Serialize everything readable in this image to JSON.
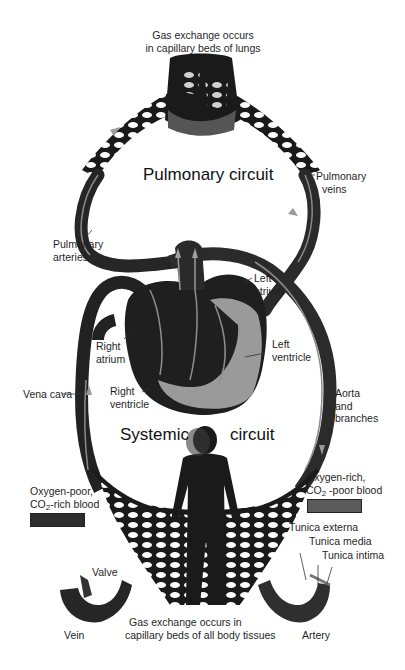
{
  "title_labels": {
    "lungs_exchange_line1": "Gas exchange occurs",
    "lungs_exchange_line2": "in capillary beds of lungs",
    "pulmonary_circuit": "Pulmonary circuit",
    "systemic_left": "Systemic",
    "systemic_right": "circuit",
    "tissues_exchange_line1": "Gas exchange occurs in",
    "tissues_exchange_line2": "capillary beds of all body tissues"
  },
  "vessel_labels": {
    "pulmonary_veins_1": "Pulmonary",
    "pulmonary_veins_2": "veins",
    "pulmonary_arteries_1": "Pulmonary",
    "pulmonary_arteries_2": "arteries",
    "vena_cava": "Vena cava",
    "aorta_1": "Aorta",
    "aorta_2": "and",
    "aorta_3": "branches"
  },
  "heart_labels": {
    "left_atrium_1": "Left",
    "left_atrium_2": "atrium",
    "left_ventricle_1": "Left",
    "left_ventricle_2": "ventricle",
    "right_atrium_1": "Right",
    "right_atrium_2": "atrium",
    "right_ventricle_1": "Right",
    "right_ventricle_2": "ventricle"
  },
  "legend": {
    "oxygen_poor_1": "Oxygen-poor,",
    "oxygen_poor_2_pre": "CO",
    "oxygen_poor_2_sub": "2",
    "oxygen_poor_2_post": "-rich blood",
    "oxygen_poor_color": "#2e2e2e",
    "oxygen_rich_1": "Oxygen-rich,",
    "oxygen_rich_2_pre": "CO",
    "oxygen_rich_2_sub": "2",
    "oxygen_rich_2_post": " -poor blood",
    "oxygen_rich_color": "#5a5a5a"
  },
  "vessel_structure": {
    "tunica_externa": "Tunica externa",
    "tunica_media": "Tunica media",
    "tunica_intima": "Tunica intima",
    "valve": "Valve",
    "vein": "Vein",
    "artery": "Artery"
  },
  "colors": {
    "vessel_dark": "#1e1e1e",
    "vessel_mid": "#3a3a3a",
    "heart_light": "#9a9a9a",
    "arrow": "#9c9c9c"
  }
}
